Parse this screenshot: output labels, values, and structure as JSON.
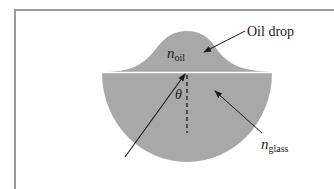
{
  "figure": {
    "labels": {
      "oil_drop": "Oil drop",
      "n_symbol": "n",
      "n_oil_sub": "oil",
      "n_glass_sub": "glass",
      "theta": "θ"
    },
    "colors": {
      "medium_fill": "#a8a8a8",
      "interface_line": "#ffffff",
      "arrow": "#1a1a1a",
      "frame": "#9a9a9a",
      "background": "#ffffff"
    },
    "elements": [
      "oil drop (bell-shaped cap above interface)",
      "glass hemisphere (semicircle below interface)",
      "incident ray arrow from lower-left toward interface point",
      "dashed normal line below interface",
      "angle theta between ray and normal",
      "pointer arrow to oil drop",
      "pointer arrow to glass"
    ]
  }
}
